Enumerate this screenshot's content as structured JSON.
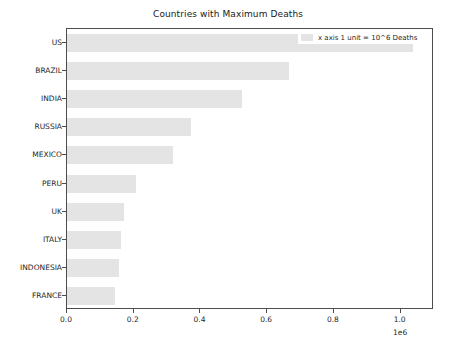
{
  "chart_data": {
    "type": "bar",
    "orientation": "horizontal",
    "title": "Countries with Maximum Deaths",
    "xlabel": "",
    "ylabel": "",
    "categories": [
      "FRANCE",
      "INDONESIA",
      "ITALY",
      "UK",
      "PERU",
      "MEXICO",
      "RUSSIA",
      "INDIA",
      "BRAZIL",
      "US"
    ],
    "values": [
      144000,
      156000,
      162000,
      171000,
      207000,
      317000,
      371000,
      524000,
      665000,
      1036000
    ],
    "xlim": [
      0,
      1100000
    ],
    "xticks": [
      0,
      200000,
      400000,
      600000,
      800000,
      1000000
    ],
    "xtick_labels": [
      "0.0",
      "0.2",
      "0.4",
      "0.6",
      "0.8",
      "1.0"
    ],
    "x_offset_text": "1e6",
    "grid": false,
    "legend": {
      "position": "upper right",
      "entries": [
        {
          "label": "x axis 1 unit = 10^6 Deaths",
          "color": "#e4e4e4"
        }
      ]
    },
    "bar_color": "#e4e4e4",
    "axis_color": "#4d4d4d"
  }
}
